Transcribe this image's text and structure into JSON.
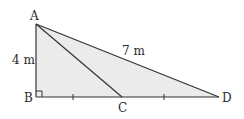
{
  "diagram": {
    "type": "geometry-right-triangle",
    "points": {
      "A": {
        "label": "A",
        "x": 36,
        "y": 24
      },
      "B": {
        "label": "B",
        "x": 36,
        "y": 97
      },
      "C": {
        "label": "C",
        "x": 122,
        "y": 97
      },
      "D": {
        "label": "D",
        "x": 219,
        "y": 97
      }
    },
    "measurements": {
      "AB": "4 m",
      "AD": "7 m"
    },
    "marks": {
      "right_angle_at": "B",
      "equal_ticks": [
        "BC",
        "CD"
      ]
    },
    "colors": {
      "fill": "#ebebeb",
      "stroke": "#333333"
    }
  }
}
